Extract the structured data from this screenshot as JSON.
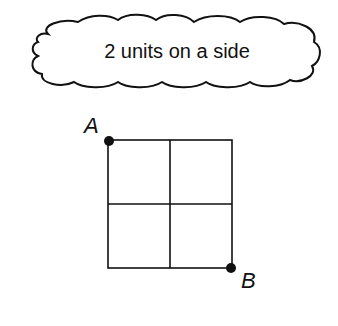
{
  "callout": {
    "text": "2 units on a side"
  },
  "grid": {
    "rows": 2,
    "cols": 2,
    "side_units": 2
  },
  "points": [
    {
      "label": "A",
      "position": "top-left"
    },
    {
      "label": "B",
      "position": "bottom-right"
    }
  ],
  "colors": {
    "stroke": "#111111",
    "background": "#ffffff"
  }
}
